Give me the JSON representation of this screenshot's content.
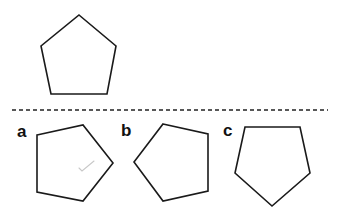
{
  "diagram": {
    "reference_pentagon": {
      "points": "79,15 116,46 107,94 51,94 41,46"
    },
    "divider": {
      "x1": 12,
      "x2": 328,
      "y": 110
    },
    "options": [
      {
        "label": "a",
        "label_x": 17,
        "label_y": 137,
        "points": "37,135 83,125 113,163 83,201 37,192"
      },
      {
        "label": "b",
        "label_x": 121,
        "label_y": 136,
        "points": "163,124 208,134 208,191 163,201 134,162"
      },
      {
        "label": "c",
        "label_x": 223,
        "label_y": 136,
        "points": "245,127 300,127 310,173 272,206 235,173"
      }
    ],
    "pencil_mark": {
      "points": "79,168 82,171 94,161"
    },
    "colors": {
      "stroke": "#1a1a1a",
      "mark": "#c8c8c8",
      "background": "#ffffff"
    }
  }
}
